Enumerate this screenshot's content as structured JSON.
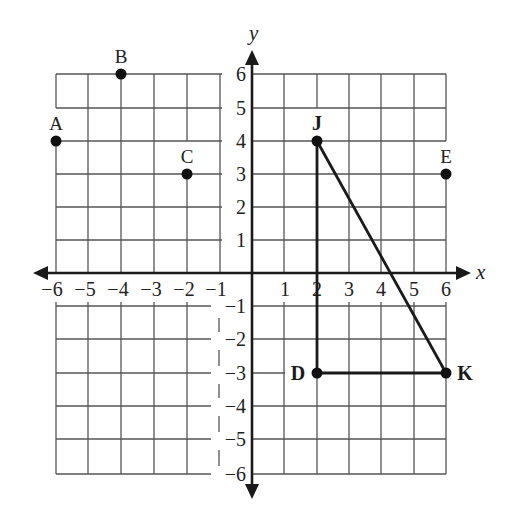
{
  "diagram": {
    "type": "coordinate-plane",
    "axes": {
      "x_label": "x",
      "y_label": "y",
      "x_range": [
        -6,
        6
      ],
      "y_range": [
        -6,
        6
      ],
      "x_ticks": [
        "−6",
        "−5",
        "−4",
        "−3",
        "−2",
        "−1",
        "1",
        "2",
        "3",
        "4",
        "5",
        "6"
      ],
      "y_ticks": [
        "6",
        "5",
        "4",
        "3",
        "2",
        "1",
        "−1",
        "−2",
        "−3",
        "−4",
        "−5",
        "−6"
      ]
    },
    "points": [
      {
        "label": "A",
        "x": -6,
        "y": 4,
        "bold": false
      },
      {
        "label": "B",
        "x": -4,
        "y": 6,
        "bold": false
      },
      {
        "label": "C",
        "x": -2,
        "y": 3,
        "bold": false
      },
      {
        "label": "E",
        "x": 6,
        "y": 3,
        "bold": false
      },
      {
        "label": "J",
        "x": 2,
        "y": 4,
        "bold": true
      },
      {
        "label": "D",
        "x": 2,
        "y": -3,
        "bold": true
      },
      {
        "label": "K",
        "x": 6,
        "y": -3,
        "bold": true
      }
    ],
    "triangle": {
      "vertices": [
        "J",
        "D",
        "K"
      ],
      "segments": [
        [
          "J",
          "D"
        ],
        [
          "D",
          "K"
        ],
        [
          "K",
          "J"
        ]
      ]
    }
  }
}
